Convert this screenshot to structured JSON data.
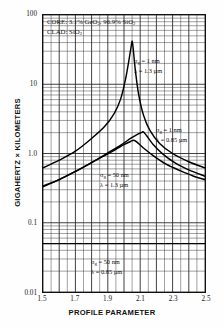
{
  "chart_data": {
    "type": "line",
    "title": "",
    "xlabel": "PROFILE PARAMETER",
    "ylabel": "GIGAHERTZ × KILOMETERS",
    "xlim": [
      1.5,
      2.5
    ],
    "ylim": [
      0.01,
      100
    ],
    "yscale": "log",
    "xticks": [
      "1.5",
      "1.7",
      "1.9",
      "2.1",
      "2.3",
      "2.5"
    ],
    "xtick_values": [
      1.5,
      1.7,
      1.9,
      2.1,
      2.3,
      2.5
    ],
    "yticks": [
      "100",
      "10",
      "1.0",
      "0.1",
      "0.01"
    ],
    "ytick_values": [
      100,
      10,
      1.0,
      0.1,
      0.01
    ],
    "grid": "log-minor-and-major",
    "legend_position": "none",
    "series": [
      {
        "name": "σg = 1 nm, λ = 1.3 µm",
        "peak_x": 2.05,
        "peak_y": 42,
        "x": [
          1.5,
          1.6,
          1.7,
          1.8,
          1.88,
          1.94,
          1.98,
          2.01,
          2.03,
          2.045,
          2.05,
          2.055,
          2.07,
          2.09,
          2.12,
          2.16,
          2.22,
          2.3,
          2.4,
          2.5
        ],
        "y": [
          0.62,
          0.8,
          1.08,
          1.65,
          2.45,
          3.8,
          6.2,
          12.0,
          22.0,
          36.0,
          42.0,
          36.0,
          16.0,
          7.2,
          3.6,
          2.15,
          1.4,
          1.0,
          0.76,
          0.62
        ]
      },
      {
        "name": "σg = 1 nm, λ = 0.85 µm",
        "peak_x": 2.12,
        "peak_y": 2.05,
        "x": [
          1.5,
          1.6,
          1.7,
          1.8,
          1.9,
          1.98,
          2.04,
          2.08,
          2.11,
          2.12,
          2.14,
          2.18,
          2.24,
          2.32,
          2.4,
          2.5
        ],
        "y": [
          0.34,
          0.42,
          0.55,
          0.74,
          1.02,
          1.32,
          1.65,
          1.88,
          2.02,
          2.05,
          1.8,
          1.35,
          0.98,
          0.72,
          0.58,
          0.47
        ]
      },
      {
        "name": "σg = 50 nm, λ = 1.3 µm",
        "peak_x": 2.06,
        "peak_y": 1.55,
        "x": [
          1.5,
          1.6,
          1.7,
          1.8,
          1.88,
          1.95,
          2.0,
          2.04,
          2.06,
          2.08,
          2.12,
          2.18,
          2.26,
          2.35,
          2.43,
          2.5
        ],
        "y": [
          0.33,
          0.42,
          0.55,
          0.74,
          0.93,
          1.15,
          1.34,
          1.49,
          1.55,
          1.46,
          1.2,
          0.93,
          0.7,
          0.56,
          0.47,
          0.42
        ]
      },
      {
        "name": "σg = 50 nm, λ = 0.85 µm",
        "peak_x": null,
        "peak_y": 0.05,
        "x": [
          1.5,
          1.7,
          1.9,
          2.1,
          2.3,
          2.5
        ],
        "y": [
          0.05,
          0.05,
          0.05,
          0.05,
          0.05,
          0.05
        ]
      }
    ],
    "annotations": [
      {
        "name": "composition-core",
        "text": "CORE:  3.1% GeO2,  96.9% SiO2"
      },
      {
        "name": "composition-clad",
        "text": "CLAD:  SiO2"
      },
      {
        "name": "curve-label-1",
        "line1": "σg = 1 nm",
        "line2": "λ = 1.3 µm"
      },
      {
        "name": "curve-label-2",
        "line1": "σg = 1 nm",
        "line2": "λ = 0.85 µm"
      },
      {
        "name": "curve-label-3",
        "line1": "σg = 50 nm",
        "line2": "λ = 1.3 µm"
      },
      {
        "name": "curve-label-4",
        "line1": "σg = 50 nm",
        "line2": "λ = 0.85 µm"
      }
    ]
  },
  "axes": {
    "x_title": "PROFILE PARAMETER",
    "y_title": "GIGAHERTZ × KILOMETERS"
  },
  "composition": {
    "core_prefix": "CORE:",
    "core_value_a": "3.1%",
    "core_sp_a": "GeO",
    "core_sub_a": "2",
    "core_comma": ",",
    "core_value_b": "96.9%",
    "core_sp_b": "SiO",
    "core_sub_b": "2",
    "clad_prefix": "CLAD:",
    "clad_sp": "SiO",
    "clad_sub": "2"
  },
  "labels": {
    "a_sigma": "σ",
    "a_sub": "g",
    "a_eq1": " = 1 nm",
    "a_lam1": "λ = 1.3 µm",
    "b_eq": " = 1 nm",
    "b_lam": "λ = 0.85 µm",
    "c_eq": " = 50 nm",
    "c_lam": "λ = 1.3 µm",
    "d_eq": " = 50 nm",
    "d_lam": "λ = 0.85 µm"
  }
}
